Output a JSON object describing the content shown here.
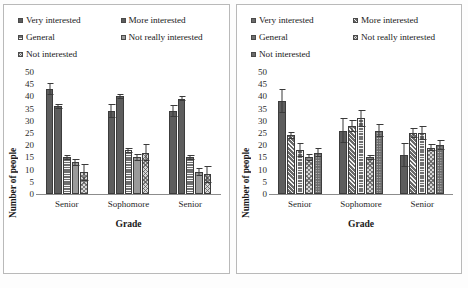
{
  "figure": {
    "panel_count": 2,
    "background": "#ffffff",
    "border_color": "#b9b9b9"
  },
  "chart_data": [
    {
      "panel": "left",
      "type": "bar",
      "title": "",
      "xlabel": "Grade",
      "ylabel": "Number of people",
      "categories": [
        "Senior",
        "Sophomore",
        "Senior"
      ],
      "ylim": [
        0,
        50
      ],
      "yticks": [
        0,
        5,
        10,
        15,
        20,
        25,
        30,
        35,
        40,
        45,
        50
      ],
      "grid": false,
      "legend_position": "top",
      "error_bars": true,
      "series": [
        {
          "name": "Very interested",
          "pattern": "dotted-dark",
          "color": "#5d5d5d",
          "values": [
            43,
            34,
            34
          ],
          "errors": [
            2.5,
            3,
            2.5
          ]
        },
        {
          "name": "More interested",
          "pattern": "solid-dark",
          "color": "#4f4f4f",
          "values": [
            36,
            40,
            39
          ],
          "errors": [
            1,
            1,
            1
          ]
        },
        {
          "name": "General",
          "pattern": "horizontal-lines",
          "color": "#6f6f6f",
          "values": [
            15,
            18,
            15
          ],
          "errors": [
            1,
            1,
            1
          ]
        },
        {
          "name": "Not really interested",
          "pattern": "solid-light",
          "color": "#9a9a9a",
          "values": [
            13,
            15,
            9
          ],
          "errors": [
            1.5,
            1.5,
            1.5
          ]
        },
        {
          "name": "Not interested",
          "pattern": "checkerboard",
          "color": "#d8d8d8",
          "values": [
            9,
            17,
            8
          ],
          "errors": [
            3.5,
            3.5,
            3.5
          ]
        }
      ]
    },
    {
      "panel": "right",
      "type": "bar",
      "title": "",
      "xlabel": "Grade",
      "ylabel": "Number of people",
      "categories": [
        "Senior",
        "Sophomore",
        "Senior"
      ],
      "ylim": [
        0,
        50
      ],
      "yticks": [
        0,
        5,
        10,
        15,
        20,
        25,
        30,
        35,
        40,
        45,
        50
      ],
      "grid": false,
      "legend_position": "top",
      "error_bars": true,
      "series": [
        {
          "name": "Very interested",
          "pattern": "dotted-dark",
          "color": "#6b6b6b",
          "values": [
            38,
            26,
            16
          ],
          "errors": [
            5,
            5,
            5
          ]
        },
        {
          "name": "More interested",
          "pattern": "diagonal-lines",
          "color": "#6a6a6a",
          "values": [
            24,
            28,
            25
          ],
          "errors": [
            1.5,
            2.5,
            2
          ]
        },
        {
          "name": "General",
          "pattern": "grid-lines",
          "color": "#707070",
          "values": [
            18,
            31,
            25
          ],
          "errors": [
            3,
            3.5,
            3
          ]
        },
        {
          "name": "Not really interested",
          "pattern": "checkerboard-dark",
          "color": "#8a8a8a",
          "values": [
            15,
            15,
            19
          ],
          "errors": [
            1.5,
            1,
            1.5
          ]
        },
        {
          "name": "Not interested",
          "pattern": "grid-dots",
          "color": "#6f6f6f",
          "values": [
            17,
            26,
            20
          ],
          "errors": [
            2,
            2.5,
            2
          ]
        }
      ]
    }
  ],
  "legend_left": {
    "items": [
      {
        "label": "Very interested",
        "swatch": "sw-dotdark"
      },
      {
        "label": "More interested",
        "swatch": "sw-dotdark"
      },
      {
        "label": "General",
        "swatch": "sw-hline"
      },
      {
        "label": "Not really interested",
        "swatch": "sw-solidlt"
      },
      {
        "label": "Not interested",
        "swatch": "sw-check"
      }
    ]
  },
  "legend_right": {
    "items": [
      {
        "label": "Very interested",
        "swatch": "sw-dotsolid"
      },
      {
        "label": "More interested",
        "swatch": "sw-diag"
      },
      {
        "label": "General",
        "swatch": "sw-grid"
      },
      {
        "label": "Not really interested",
        "swatch": "sw-check"
      },
      {
        "label": "Not interested",
        "swatch": "sw-dotsolid"
      }
    ]
  }
}
